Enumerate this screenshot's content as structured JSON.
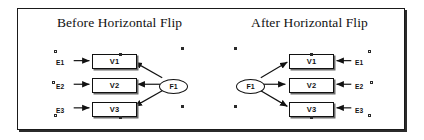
{
  "figure": {
    "background_color": "#ffffff",
    "line_color": "#111111",
    "frame_border_color": "#1a1a1a"
  },
  "panels": [
    {
      "id": "before",
      "title": "Before Horizontal Flip",
      "factor": {
        "label": "F1",
        "position": "right"
      },
      "indicators": [
        {
          "box_label": "V1",
          "error_label": "E1"
        },
        {
          "box_label": "V2",
          "error_label": "E2"
        },
        {
          "box_label": "V3",
          "error_label": "E3"
        }
      ]
    },
    {
      "id": "after",
      "title": "After Horizontal Flip",
      "factor": {
        "label": "F1",
        "position": "left"
      },
      "indicators": [
        {
          "box_label": "V1",
          "error_label": "E1"
        },
        {
          "box_label": "V2",
          "error_label": "E2"
        },
        {
          "box_label": "V3",
          "error_label": "E3"
        }
      ]
    }
  ]
}
